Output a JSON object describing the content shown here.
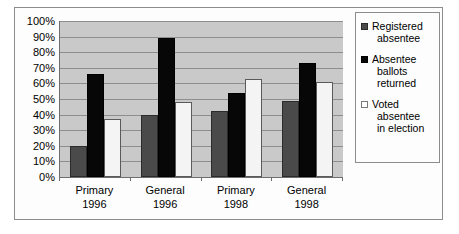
{
  "chart_data": {
    "type": "bar",
    "title": "",
    "subtitle": "",
    "xlabel": "",
    "ylabel": "",
    "ylim": [
      0,
      100
    ],
    "y_tick_labels": [
      "100%",
      "90%",
      "80%",
      "70%",
      "60%",
      "50%",
      "40%",
      "30%",
      "20%",
      "10%",
      "0%"
    ],
    "y_tick_values": [
      100,
      90,
      80,
      70,
      60,
      50,
      40,
      30,
      20,
      10,
      0
    ],
    "grid": true,
    "legend_position": "right",
    "categories": [
      "Primary 1996",
      "General 1996",
      "Primary 1998",
      "General 1998"
    ],
    "category_lines": [
      [
        "Primary",
        "1996"
      ],
      [
        "General",
        "1996"
      ],
      [
        "Primary",
        "1998"
      ],
      [
        "General",
        "1998"
      ]
    ],
    "series": [
      {
        "name": "Registered absentee",
        "name_lines": [
          "Registered",
          "absentee"
        ],
        "color": "#4a4a4a",
        "values": [
          20,
          40,
          42,
          49
        ]
      },
      {
        "name": "Absentee ballots returned",
        "name_lines": [
          "Absentee",
          "ballots",
          "returned"
        ],
        "color": "#070707",
        "values": [
          66,
          89,
          54,
          73
        ]
      },
      {
        "name": "Voted absentee in election",
        "name_lines": [
          "Voted",
          "absentee",
          "in election"
        ],
        "color": "#f4f4f4",
        "values": [
          37,
          48,
          63,
          61
        ]
      }
    ]
  }
}
